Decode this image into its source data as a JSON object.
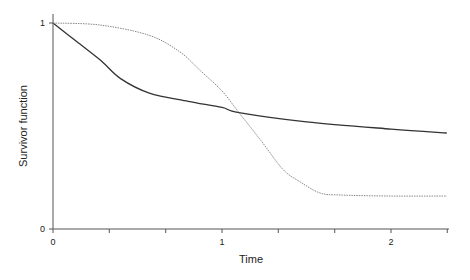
{
  "chart_data": {
    "type": "line",
    "title": "",
    "xlabel": "Time",
    "ylabel": "Survivor function",
    "xlim": [
      0,
      2.33
    ],
    "ylim": [
      0,
      1
    ],
    "x_ticks": [
      0,
      0.333,
      0.667,
      1,
      1.333,
      1.667,
      2,
      2.333
    ],
    "x_tick_labels": [
      "0",
      "",
      "",
      "1",
      "",
      "",
      "2",
      ""
    ],
    "y_ticks": [
      0,
      1
    ],
    "y_tick_labels": [
      "0",
      "1"
    ],
    "grid": false,
    "legend": null,
    "series": [
      {
        "name": "solid",
        "style": "solid",
        "color": "#333333",
        "x": [
          0,
          0.14,
          0.28,
          0.4,
          0.57,
          0.8,
          1.0,
          1.1,
          1.5,
          2.0,
          2.33
        ],
        "y": [
          1.0,
          0.91,
          0.82,
          0.73,
          0.66,
          0.62,
          0.59,
          0.565,
          0.52,
          0.485,
          0.466
        ]
      },
      {
        "name": "dotted",
        "style": "dotted",
        "color": "#888888",
        "x": [
          0,
          0.28,
          0.57,
          0.75,
          0.87,
          1.0,
          1.1,
          1.23,
          1.36,
          1.46,
          1.58,
          1.7,
          2.0,
          2.33
        ],
        "y": [
          1.0,
          0.99,
          0.94,
          0.86,
          0.77,
          0.67,
          0.565,
          0.43,
          0.29,
          0.23,
          0.175,
          0.165,
          0.16,
          0.16
        ]
      }
    ]
  }
}
